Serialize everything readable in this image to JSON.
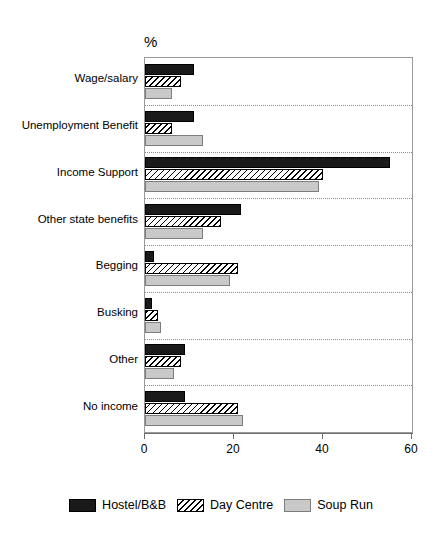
{
  "chart_data": {
    "type": "bar",
    "orientation": "horizontal",
    "title": "",
    "subtitle": "",
    "unit_label": "%",
    "xlabel": "",
    "ylabel": "",
    "xlim": [
      0,
      60
    ],
    "xticks": [
      0,
      20,
      40,
      60
    ],
    "xtick_labels": [
      "0",
      "20",
      "40",
      "60"
    ],
    "grid": "horizontal-dotted-between-categories",
    "legend_position": "bottom-center",
    "categories": [
      "Wage/salary",
      "Unemployment Benefit",
      "Income Support",
      "Other state benefits",
      "Begging",
      "Busking",
      "Other",
      "No income"
    ],
    "series": [
      {
        "name": "Hostel/B&B",
        "style": "solid-black",
        "color": "#1a1a1a",
        "values": [
          11,
          11,
          55,
          21.5,
          2,
          1.5,
          9,
          9
        ]
      },
      {
        "name": "Day Centre",
        "style": "diagonal-hatch",
        "color": "#ffffff",
        "values": [
          8,
          6,
          40,
          17,
          21,
          3,
          8,
          21
        ]
      },
      {
        "name": "Soup Run",
        "style": "solid-gray",
        "color": "#c9c9c9",
        "values": [
          6,
          13,
          39,
          13,
          19,
          3.5,
          6.5,
          22
        ]
      }
    ]
  },
  "legend": {
    "items": [
      {
        "label": "Hostel/B&B",
        "swatch": "black"
      },
      {
        "label": "Day Centre",
        "swatch": "hatch"
      },
      {
        "label": "Soup Run",
        "swatch": "gray"
      }
    ]
  }
}
